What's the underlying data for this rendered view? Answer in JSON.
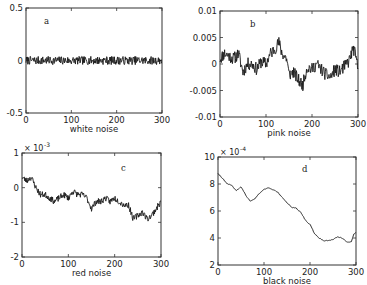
{
  "figure": {
    "panels": [
      {
        "id": "a",
        "label": "a",
        "xlabel": "white noise"
      },
      {
        "id": "b",
        "label": "b",
        "xlabel": "pink noise"
      },
      {
        "id": "c",
        "label": "c",
        "xlabel": "red noise"
      },
      {
        "id": "d",
        "label": "d",
        "xlabel": "black noise"
      }
    ]
  },
  "chart_data": [
    {
      "type": "line",
      "title": "a",
      "xlabel": "white noise",
      "ylabel": "",
      "xlim": [
        0,
        300
      ],
      "ylim": [
        -0.5,
        0.5
      ],
      "xticks": [
        0,
        100,
        200,
        300
      ],
      "yticks": [
        -0.5,
        0,
        0.5
      ],
      "ytick_labels": [
        "-0.5",
        "0",
        "0.5"
      ],
      "multiplier": "",
      "box": {
        "x0": 26,
        "y0": 8,
        "x1": 162,
        "y1": 113
      },
      "label_pos": {
        "x": 44,
        "y": 24
      },
      "kind": "white",
      "amplitude": 0.04,
      "seed": 7
    },
    {
      "type": "line",
      "title": "b",
      "xlabel": "pink noise",
      "ylabel": "",
      "xlim": [
        0,
        300
      ],
      "ylim": [
        -0.01,
        0.01
      ],
      "xticks": [
        0,
        100,
        200,
        300
      ],
      "yticks": [
        -0.01,
        -0.005,
        0,
        0.005,
        0.01
      ],
      "ytick_labels": [
        "-0.01",
        "-0.005",
        "0",
        "0.005",
        "0.01"
      ],
      "multiplier": "",
      "box": {
        "x0": 220,
        "y0": 11,
        "x1": 358,
        "y1": 117
      },
      "label_pos": {
        "x": 250,
        "y": 27
      },
      "anchors": [
        [
          0,
          0.001
        ],
        [
          10,
          0.002
        ],
        [
          20,
          0.0015
        ],
        [
          30,
          0.001
        ],
        [
          40,
          0.002
        ],
        [
          50,
          -0.0015
        ],
        [
          60,
          0.0
        ],
        [
          70,
          0.0
        ],
        [
          80,
          -0.001
        ],
        [
          90,
          0.0005
        ],
        [
          100,
          0.0
        ],
        [
          110,
          0.002
        ],
        [
          120,
          0.003
        ],
        [
          128,
          0.004
        ],
        [
          135,
          0.002
        ],
        [
          145,
          0.001
        ],
        [
          150,
          -0.002
        ],
        [
          160,
          -0.0015
        ],
        [
          170,
          -0.003
        ],
        [
          180,
          -0.004
        ],
        [
          185,
          -0.002
        ],
        [
          190,
          -0.0005
        ],
        [
          200,
          -0.001
        ],
        [
          210,
          0.0
        ],
        [
          220,
          -0.001
        ],
        [
          230,
          -0.002
        ],
        [
          240,
          -0.0025
        ],
        [
          250,
          -0.001
        ],
        [
          260,
          -0.0015
        ],
        [
          270,
          -0.0005
        ],
        [
          280,
          0.0005
        ],
        [
          290,
          0.003
        ],
        [
          296,
          0.001
        ],
        [
          300,
          -0.001
        ]
      ],
      "jitter": 0.0012,
      "seed": 11
    },
    {
      "type": "line",
      "title": "c",
      "xlabel": "red noise",
      "ylabel": "",
      "xlim": [
        0,
        300
      ],
      "ylim": [
        -0.002,
        0.001
      ],
      "xticks": [
        0,
        100,
        200,
        300
      ],
      "yticks": [
        -0.002,
        -0.001,
        0,
        0.001
      ],
      "ytick_labels": [
        "-2",
        "-1",
        "0",
        "1"
      ],
      "multiplier": "× 10^-3",
      "multiplier_base": "× 10",
      "multiplier_exp": "-3",
      "box": {
        "x0": 22,
        "y0": 153,
        "x1": 161,
        "y1": 257
      },
      "label_pos": {
        "x": 121,
        "y": 171
      },
      "anchors": [
        [
          0,
          0.0003
        ],
        [
          10,
          0.0002
        ],
        [
          20,
          0.0003
        ],
        [
          30,
          0.0
        ],
        [
          40,
          -0.0002
        ],
        [
          50,
          -0.0002
        ],
        [
          60,
          -0.0003
        ],
        [
          70,
          -0.0004
        ],
        [
          80,
          -0.0003
        ],
        [
          90,
          -0.0002
        ],
        [
          100,
          -0.0003
        ],
        [
          110,
          -0.0001
        ],
        [
          120,
          -0.0002
        ],
        [
          130,
          -0.0002
        ],
        [
          140,
          -0.0003
        ],
        [
          150,
          -0.0006
        ],
        [
          160,
          -0.0004
        ],
        [
          170,
          -0.0004
        ],
        [
          180,
          -0.0003
        ],
        [
          190,
          -0.0004
        ],
        [
          200,
          -0.0003
        ],
        [
          210,
          -0.0004
        ],
        [
          220,
          -0.0005
        ],
        [
          230,
          -0.0005
        ],
        [
          240,
          -0.0009
        ],
        [
          250,
          -0.0008
        ],
        [
          260,
          -0.0007
        ],
        [
          270,
          -0.0009
        ],
        [
          280,
          -0.0008
        ],
        [
          290,
          -0.0006
        ],
        [
          300,
          -0.0004
        ]
      ],
      "jitter": 9e-05,
      "seed": 23
    },
    {
      "type": "line",
      "title": "d",
      "xlabel": "black noise",
      "ylabel": "",
      "xlim": [
        0,
        300
      ],
      "ylim": [
        0.0002,
        0.001
      ],
      "xticks": [
        0,
        100,
        200,
        300
      ],
      "yticks": [
        0.0002,
        0.0004,
        0.0006,
        0.0008,
        0.001
      ],
      "ytick_labels": [
        "2",
        "4",
        "6",
        "8",
        "10"
      ],
      "multiplier": "× 10^-4",
      "multiplier_base": "× 10",
      "multiplier_exp": "-4",
      "box": {
        "x0": 218,
        "y0": 157,
        "x1": 356,
        "y1": 265
      },
      "label_pos": {
        "x": 302,
        "y": 172
      },
      "anchors": [
        [
          0,
          0.00088
        ],
        [
          10,
          0.00084
        ],
        [
          20,
          0.0008
        ],
        [
          30,
          0.00079
        ],
        [
          40,
          0.00075
        ],
        [
          50,
          0.00078
        ],
        [
          60,
          0.00072
        ],
        [
          70,
          0.00067
        ],
        [
          80,
          0.00069
        ],
        [
          90,
          0.00073
        ],
        [
          100,
          0.00076
        ],
        [
          110,
          0.00077
        ],
        [
          120,
          0.00076
        ],
        [
          130,
          0.00074
        ],
        [
          140,
          0.0007
        ],
        [
          150,
          0.00066
        ],
        [
          160,
          0.00063
        ],
        [
          170,
          0.00062
        ],
        [
          180,
          0.00059
        ],
        [
          190,
          0.00053
        ],
        [
          200,
          0.0005
        ],
        [
          210,
          0.00043
        ],
        [
          220,
          0.0004
        ],
        [
          230,
          0.00038
        ],
        [
          240,
          0.00038
        ],
        [
          250,
          0.00039
        ],
        [
          260,
          0.00041
        ],
        [
          270,
          0.0004
        ],
        [
          280,
          0.00037
        ],
        [
          290,
          0.00037
        ],
        [
          295,
          0.00043
        ],
        [
          300,
          0.00044
        ]
      ],
      "jitter": 6e-06,
      "seed": 31
    }
  ]
}
